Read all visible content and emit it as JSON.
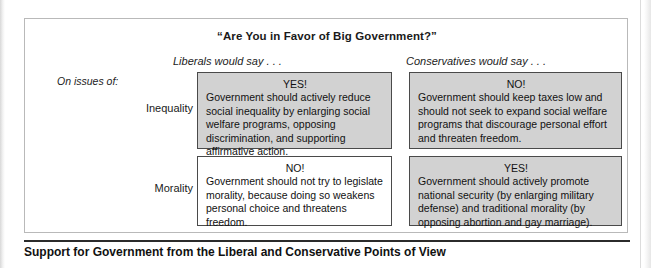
{
  "figure": {
    "title": "“Are You in Favor of Big Government?”",
    "caption": "Support for Government from the Liberal and Conservative Points of View",
    "row_axis_label": "On issues of:",
    "columns": [
      {
        "key": "liberals",
        "label": "Liberals would say . . ."
      },
      {
        "key": "conservatives",
        "label": "Conservatives would say . . ."
      }
    ],
    "rows": [
      {
        "key": "inequality",
        "label": "Inequality"
      },
      {
        "key": "morality",
        "label": "Morality"
      }
    ],
    "cells": {
      "liberals_inequality": {
        "answer": "YES!",
        "text": "Government should actively reduce social inequality by enlarging social welfare programs, opposing discrimination, and supporting affirmative action.",
        "shaded": true
      },
      "conservatives_inequality": {
        "answer": "NO!",
        "text": "Government should keep taxes low and should not seek to expand social welfare programs that discourage personal effort and threaten freedom.",
        "shaded": true
      },
      "liberals_morality": {
        "answer": "NO!",
        "text": "Government should not try to legislate morality, because doing so weakens personal choice and threatens freedom.",
        "shaded": false
      },
      "conservatives_morality": {
        "answer": "YES!",
        "text": "Government should actively promote national security (by enlarging military defense) and traditional morality (by opposing abortion and gay marriage).",
        "shaded": true
      }
    },
    "colors": {
      "shaded_cell": "#d2d2d2",
      "plain_cell": "#ffffff",
      "cell_border": "#4a4a4a",
      "box_border": "#b9b9b9",
      "caption_rule": "#2b2b2b",
      "text": "#111111"
    }
  }
}
